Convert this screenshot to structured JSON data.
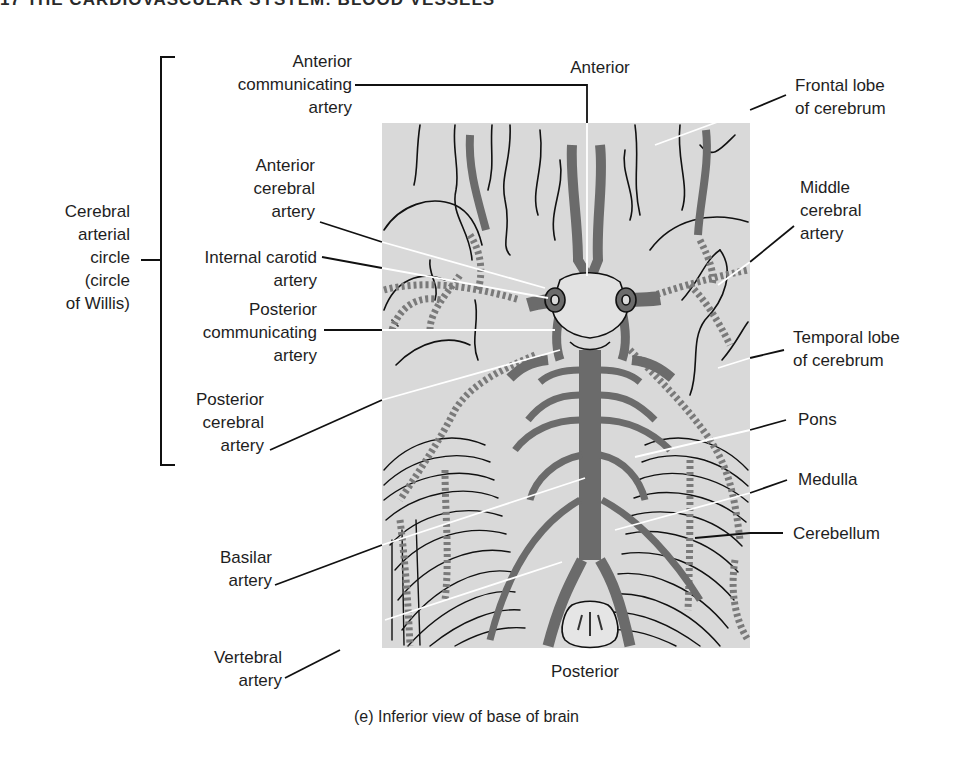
{
  "header": {
    "text": "17  THE CARDIOVASCULAR SYSTEM: BLOOD VESSELS"
  },
  "orientation": {
    "top": "Anterior",
    "bottom": "Posterior"
  },
  "bracket_label": {
    "lines": [
      "Cerebral",
      "arterial",
      "circle",
      "(circle",
      "of Willis)"
    ]
  },
  "left_labels": {
    "anterior_communicating": [
      "Anterior",
      "communicating",
      "artery"
    ],
    "anterior_cerebral": [
      "Anterior",
      "cerebral",
      "artery"
    ],
    "internal_carotid": [
      "Internal carotid",
      "artery"
    ],
    "posterior_communicating": [
      "Posterior",
      "communicating",
      "artery"
    ],
    "posterior_cerebral": [
      "Posterior",
      "cerebral",
      "artery"
    ],
    "basilar": [
      "Basilar",
      "artery"
    ],
    "vertebral": [
      "Vertebral",
      "artery"
    ]
  },
  "right_labels": {
    "frontal_lobe": [
      "Frontal lobe",
      "of cerebrum"
    ],
    "middle_cerebral": [
      "Middle",
      "cerebral",
      "artery"
    ],
    "temporal_lobe": [
      "Temporal lobe",
      "of cerebrum"
    ],
    "pons": [
      "Pons"
    ],
    "medulla": [
      "Medulla"
    ],
    "cerebellum": [
      "Cerebellum"
    ]
  },
  "caption": "(e) Inferior view of base of brain",
  "colors": {
    "panel": "#d9d9d9",
    "artery": "#6b6b6b",
    "outline": "#111111",
    "leader_inside": "#ffffff",
    "leader_outside": "#111111"
  }
}
